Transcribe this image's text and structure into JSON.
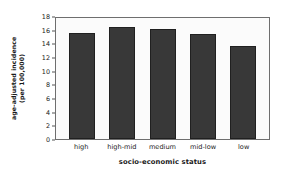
{
  "chart_data": {
    "type": "bar",
    "title": "",
    "categories": [
      "high",
      "high-mid",
      "medium",
      "mid-low",
      "low"
    ],
    "values": [
      15.5,
      16.4,
      16.1,
      15.4,
      13.6
    ],
    "xlabel": "socio-economic status",
    "ylabel_line1": "age-adjusted incidence",
    "ylabel_line2": "(per 100,000)",
    "ylim": [
      0,
      18
    ],
    "yticks": [
      0,
      2,
      4,
      6,
      8,
      10,
      12,
      14,
      16,
      18
    ],
    "ytick_labels": [
      "0",
      "2",
      "4",
      "6",
      "8",
      "10",
      "12",
      "14",
      "16",
      "18"
    ],
    "grid": false,
    "legend": false,
    "bar_color": "#383838",
    "frame_color": "#6e6e6e",
    "background_color": "#ffffff"
  }
}
